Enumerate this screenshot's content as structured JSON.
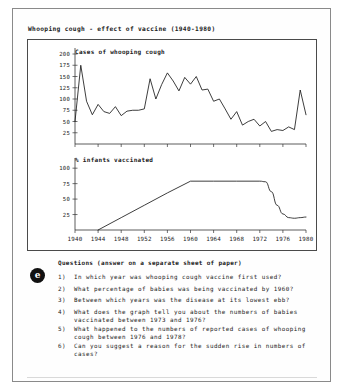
{
  "worksheet": {
    "title": "Whooping cough - effect of vaccine (1940-1980)",
    "marker_letter": "e",
    "questions_heading": "Questions (answer on a separate sheet of paper)",
    "questions": [
      {
        "num": "1)",
        "line1": "In which year was whooping cough vaccine first used?",
        "line2": ""
      },
      {
        "num": "2)",
        "line1": "What percentage of babies was being vaccinated by 1960?",
        "line2": ""
      },
      {
        "num": "3)",
        "line1": "Between which years was the disease at its lowest ebb?",
        "line2": ""
      },
      {
        "num": "4)",
        "line1": "What does the graph tell you about the numbers of babies",
        "line2": "vaccinated between 1973 and 1976?"
      },
      {
        "num": "5)",
        "line1": "What happened to the numbers of reported cases of whooping",
        "line2": "cough between 1976 and 1978?"
      },
      {
        "num": "6)",
        "line1": "Can you suggest a reason for the sudden rise in numbers of",
        "line2": "cases?"
      }
    ]
  },
  "chart_data": [
    {
      "type": "line",
      "title": "Cases of whooping cough",
      "xlabel": "",
      "ylabel": "",
      "xlim": [
        1940,
        1980
      ],
      "ylim": [
        0,
        200
      ],
      "yticks": [
        25,
        50,
        75,
        100,
        125,
        150,
        175,
        200
      ],
      "xticks": [
        1940,
        1944,
        1948,
        1952,
        1956,
        1960,
        1964,
        1968,
        1972,
        1976,
        1980
      ],
      "grid": false,
      "legend": "none",
      "x": [
        1940,
        1941,
        1942,
        1943,
        1944,
        1945,
        1946,
        1947,
        1948,
        1949,
        1950,
        1951,
        1952,
        1953,
        1954,
        1955,
        1956,
        1957,
        1958,
        1959,
        1960,
        1961,
        1962,
        1963,
        1964,
        1965,
        1966,
        1967,
        1968,
        1969,
        1970,
        1971,
        1972,
        1973,
        1974,
        1975,
        1976,
        1977,
        1978,
        1979,
        1980
      ],
      "values": [
        50,
        175,
        95,
        65,
        88,
        72,
        68,
        83,
        63,
        73,
        75,
        75,
        78,
        145,
        100,
        132,
        158,
        140,
        118,
        148,
        133,
        150,
        120,
        122,
        95,
        100,
        78,
        55,
        72,
        42,
        50,
        55,
        40,
        50,
        28,
        32,
        30,
        38,
        32,
        120,
        65
      ]
    },
    {
      "type": "line",
      "title": "% infants vaccinated",
      "xlabel": "",
      "ylabel": "",
      "xlim": [
        1940,
        1980
      ],
      "ylim": [
        0,
        110
      ],
      "yticks": [
        25,
        50,
        75,
        100
      ],
      "xticks": [
        1940,
        1944,
        1948,
        1952,
        1956,
        1960,
        1964,
        1968,
        1972,
        1976,
        1980
      ],
      "grid": false,
      "legend": "none",
      "x": [
        1944,
        1948,
        1952,
        1956,
        1960,
        1964,
        1968,
        1972,
        1973,
        1974,
        1975,
        1976,
        1977,
        1978,
        1979,
        1980
      ],
      "values": [
        0,
        20,
        40,
        60,
        79,
        79,
        79,
        79,
        78,
        62,
        40,
        26,
        20,
        19,
        20,
        21
      ]
    }
  ]
}
